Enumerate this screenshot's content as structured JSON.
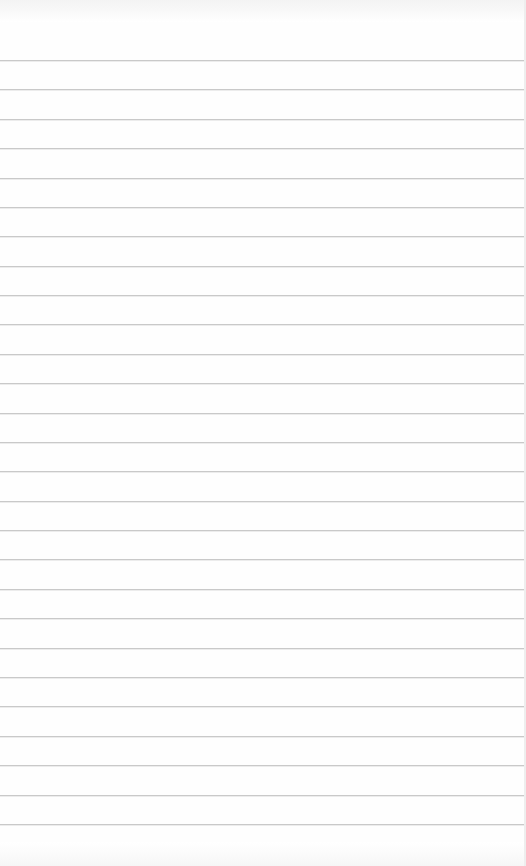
{
  "page": {
    "type": "ruled-paper",
    "background_color": "#fefefe",
    "line_color": "#c9c9c9",
    "line_count": 27,
    "first_line_y": 60,
    "line_spacing": 29.38,
    "text_content": ""
  }
}
